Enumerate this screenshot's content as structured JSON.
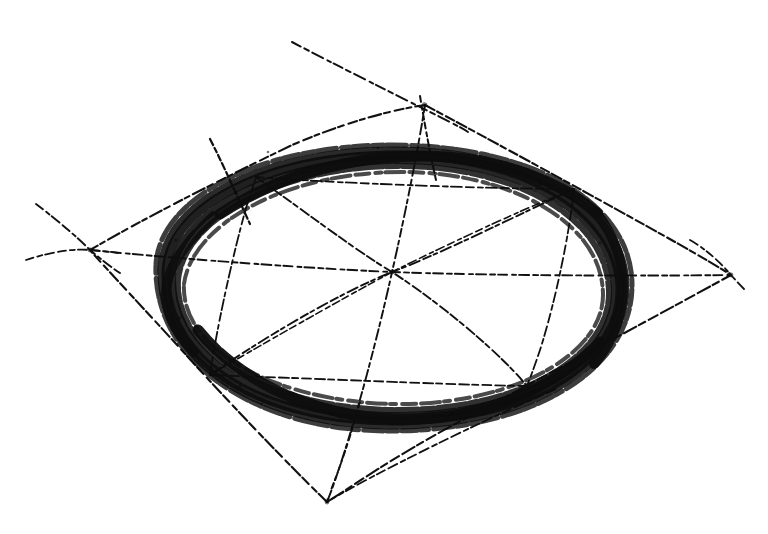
{
  "document": {
    "title": "Perspective Circle Construction Sketch",
    "medium": "graphite / charcoal on paper",
    "background_color": "#ffffff",
    "ink_color": "#111111",
    "canvas": {
      "width": 768,
      "height": 534
    }
  },
  "drawing": {
    "subject": "circle inscribed in a square drawn in two-point perspective",
    "style": "freehand, broken, grainy pencil strokes",
    "elements": [
      {
        "name": "perspective-square",
        "description": "quadrilateral (square in perspective) enclosing the ellipse"
      },
      {
        "name": "inscribed-ellipse",
        "description": "heavy dark ellipse representing a circle in perspective"
      },
      {
        "name": "diagonals",
        "description": "two diagonals of the quadrilateral crossing at the centre"
      },
      {
        "name": "midlines",
        "description": "two lines joining midpoints of opposite edges through the centre"
      },
      {
        "name": "inner-octagon",
        "description": "inner construction quadrilateral joining edge midpoints"
      },
      {
        "name": "extension-lines",
        "description": "construction lines overshooting past the corners"
      },
      {
        "name": "tangent-ticks",
        "description": "short ticks crossing the ellipse at tangent points"
      }
    ],
    "geometry": {
      "square_vertices": {
        "top": [
          425,
          105
        ],
        "right": [
          731,
          275
        ],
        "bottom": [
          327,
          502
        ],
        "left": [
          90,
          250
        ]
      },
      "center": [
        392,
        272
      ],
      "edge_midpoints": {
        "top_right": [
          574,
          189
        ],
        "bottom_right": [
          527,
          386
        ],
        "bottom_left": [
          210,
          375
        ],
        "top_left": [
          256,
          177
        ]
      },
      "ellipse": {
        "center": [
          393,
          286
        ],
        "radius_x": 228,
        "radius_y": 133,
        "rotation_deg": -8,
        "stroke_weight": "heavy"
      },
      "extension_segments": [
        {
          "from": [
            292,
            42
          ],
          "to": [
            460,
            130
          ],
          "name": "top-left-overshoot"
        },
        {
          "from": [
            36,
            204
          ],
          "to": [
            120,
            272
          ],
          "name": "left-upper-overshoot"
        },
        {
          "from": [
            28,
            258
          ],
          "to": [
            112,
            235
          ],
          "name": "left-lower-overshoot"
        },
        {
          "from": [
            700,
            246
          ],
          "to": [
            760,
            272
          ],
          "name": "right-overshoot"
        },
        {
          "from": [
            210,
            139
          ],
          "to": [
            250,
            224
          ],
          "name": "tangent-tick-upper-left"
        },
        {
          "from": [
            420,
            96
          ],
          "to": [
            436,
            178
          ],
          "name": "tangent-tick-top"
        }
      ]
    },
    "stroke_counts": {
      "quadrilateral_edges": 4,
      "diagonals": 2,
      "midlines": 2,
      "inner_quad_edges": 4,
      "radial_spokes": 8
    }
  }
}
